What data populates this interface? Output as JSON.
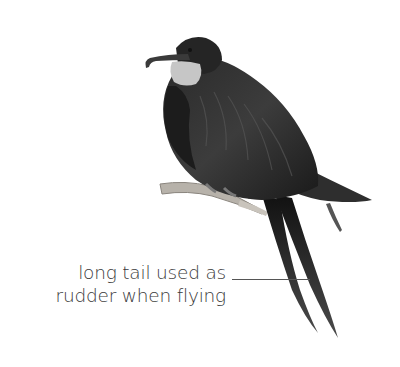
{
  "figure": {
    "annotation": {
      "line1": "long tail used as",
      "line2": "rudder when flying"
    },
    "colors": {
      "background": "#ffffff",
      "text": "#3a3a3a",
      "leader_line": "#555555",
      "bird_dark": "#1e1e1e",
      "throat_pouch": "#c8c8c8",
      "branch": "#b5b0a8"
    }
  }
}
